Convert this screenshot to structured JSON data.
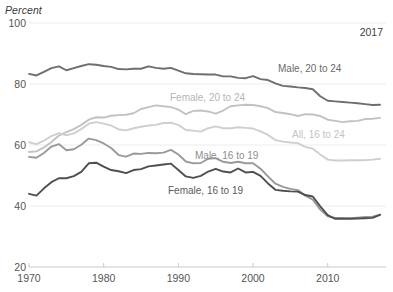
{
  "chart_data": {
    "type": "line",
    "title": "",
    "ylabel": "Percent",
    "xlabel": "",
    "annotation": "2017",
    "ylim": [
      20,
      100
    ],
    "xlim": [
      1970,
      2017
    ],
    "yticks": [
      20,
      40,
      60,
      80,
      100
    ],
    "xticks": [
      1970,
      1980,
      1990,
      2000,
      2010
    ],
    "grid": true,
    "legend_position": "inline-labels",
    "x": [
      1970,
      1971,
      1972,
      1973,
      1974,
      1975,
      1976,
      1977,
      1978,
      1979,
      1980,
      1981,
      1982,
      1983,
      1984,
      1985,
      1986,
      1987,
      1988,
      1989,
      1990,
      1991,
      1992,
      1993,
      1994,
      1995,
      1996,
      1997,
      1998,
      1999,
      2000,
      2001,
      2002,
      2003,
      2004,
      2005,
      2006,
      2007,
      2008,
      2009,
      2010,
      2011,
      2012,
      2013,
      2014,
      2015,
      2016,
      2017
    ],
    "series": [
      {
        "name": "Male, 20 to 24",
        "color": "#6e6e6e",
        "label_color": "#6a6a6a",
        "label_x": 278,
        "label_y": 68,
        "values": [
          83.3,
          82.8,
          84.0,
          85.2,
          85.8,
          84.5,
          85.2,
          85.9,
          86.5,
          86.3,
          85.9,
          85.6,
          84.9,
          84.8,
          85.0,
          85.0,
          85.8,
          85.3,
          85.0,
          85.3,
          84.4,
          83.5,
          83.3,
          83.2,
          83.1,
          83.1,
          82.5,
          82.5,
          82.0,
          81.9,
          82.6,
          81.6,
          81.3,
          80.2,
          79.4,
          79.2,
          78.9,
          78.7,
          78.3,
          76.0,
          74.5,
          74.3,
          74.1,
          73.9,
          73.7,
          73.4,
          73.1,
          73.2
        ]
      },
      {
        "name": "Female, 20 to 24",
        "color": "#c2c2c2",
        "label_color": "#b6b6b6",
        "label_x": 170,
        "label_y": 97,
        "values": [
          57.7,
          57.9,
          59.2,
          61.0,
          63.1,
          64.2,
          65.2,
          66.6,
          68.3,
          69.1,
          69.0,
          69.6,
          69.8,
          69.9,
          70.4,
          71.8,
          72.4,
          73.0,
          72.7,
          72.4,
          71.6,
          70.1,
          71.2,
          71.3,
          71.0,
          70.3,
          71.3,
          72.7,
          73.0,
          73.2,
          73.1,
          72.7,
          72.1,
          70.8,
          70.5,
          70.1,
          69.5,
          70.1,
          70.0,
          69.5,
          68.3,
          67.9,
          67.5,
          67.8,
          67.9,
          68.5,
          68.6,
          68.9
        ]
      },
      {
        "name": "All, 16 to 24",
        "color": "#cfcfcf",
        "label_color": "#c3c3c3",
        "label_x": 292,
        "label_y": 134,
        "values": [
          60.9,
          60.3,
          61.4,
          62.9,
          63.9,
          63.2,
          63.8,
          65.2,
          67.0,
          67.5,
          67.0,
          66.4,
          65.1,
          64.8,
          65.5,
          66.0,
          66.4,
          66.6,
          67.2,
          67.3,
          66.6,
          64.9,
          64.7,
          64.4,
          65.5,
          66.1,
          65.5,
          65.5,
          65.8,
          65.6,
          65.4,
          64.5,
          63.3,
          61.6,
          61.1,
          60.8,
          60.6,
          59.4,
          58.8,
          56.9,
          55.2,
          54.9,
          54.9,
          55.0,
          55.0,
          55.0,
          55.2,
          55.5
        ]
      },
      {
        "name": "Male, 16 to 19",
        "color": "#9a9a9a",
        "label_color": "#8e8e8e",
        "label_x": 195,
        "label_y": 155,
        "values": [
          56.1,
          55.8,
          57.4,
          59.5,
          60.3,
          58.3,
          58.6,
          60.1,
          62.1,
          61.6,
          60.5,
          59.0,
          56.7,
          56.2,
          57.2,
          57.1,
          57.4,
          57.3,
          57.5,
          58.4,
          56.9,
          54.6,
          54.0,
          54.1,
          55.5,
          55.7,
          54.5,
          54.1,
          54.5,
          54.0,
          54.0,
          52.2,
          49.7,
          47.3,
          46.3,
          45.6,
          45.2,
          43.4,
          42.1,
          38.8,
          36.6,
          36.1,
          36.1,
          36.0,
          36.2,
          36.4,
          36.5,
          37.2
        ]
      },
      {
        "name": "Female, 16 to 19",
        "color": "#4f4f4f",
        "label_color": "#5b5b5b",
        "label_x": 168,
        "label_y": 190,
        "values": [
          44.0,
          43.4,
          45.8,
          47.8,
          49.1,
          49.1,
          49.8,
          51.2,
          54.0,
          54.2,
          52.9,
          51.8,
          51.4,
          50.8,
          51.8,
          52.1,
          53.0,
          53.3,
          53.6,
          53.9,
          51.8,
          49.7,
          49.2,
          49.9,
          51.3,
          52.2,
          51.3,
          51.0,
          52.3,
          51.0,
          51.2,
          49.9,
          47.4,
          45.3,
          45.0,
          44.8,
          44.7,
          43.6,
          43.1,
          39.9,
          37.0,
          35.8,
          35.8,
          35.8,
          35.9,
          36.0,
          36.1,
          37.1
        ]
      }
    ]
  },
  "axis": {
    "ylabel": "Percent",
    "annotation": "2017",
    "ytick_labels": [
      "20",
      "40",
      "60",
      "80",
      "100"
    ],
    "xtick_labels": [
      "1970",
      "1980",
      "1990",
      "2000",
      "2010"
    ]
  },
  "colors": {
    "background": "#ffffff",
    "gridline": "#ededed",
    "axis_line": "#c8c8c8",
    "tick_text": "#555555"
  }
}
